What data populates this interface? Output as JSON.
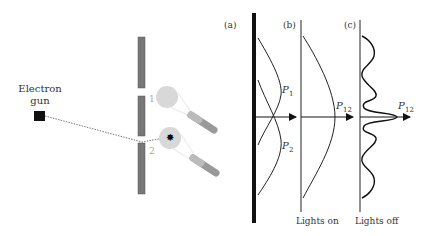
{
  "source": {
    "label_line1": "Electron",
    "label_line2": "gun"
  },
  "slits": {
    "slit1_label": "1",
    "slit2_label": "2"
  },
  "panels": {
    "a": {
      "tag": "(a)",
      "p1": "P",
      "p1_sub": "1",
      "p2": "P",
      "p2_sub": "2"
    },
    "b": {
      "tag": "(b)",
      "curve": "P",
      "curve_sub": "12",
      "caption": "Lights on"
    },
    "c": {
      "tag": "(c)",
      "curve": "P",
      "curve_sub": "12",
      "caption": "Lights off"
    }
  },
  "colors": {
    "barrier": "#777777",
    "light_glow": "#d8d8d8",
    "lamp": "#999999",
    "ink": "#222222"
  }
}
